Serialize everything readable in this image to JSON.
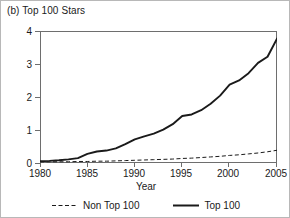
{
  "panel": {
    "title": "(b) Top 100 Stars"
  },
  "chart_data": {
    "type": "line",
    "title": "(b) Top 100 Stars",
    "xlabel": "Year",
    "ylabel": "",
    "xlim": [
      1980,
      2005
    ],
    "ylim": [
      0,
      4.35
    ],
    "xticks": [
      1980,
      1985,
      1990,
      1995,
      2000,
      2005
    ],
    "yticks": [
      0,
      1,
      2,
      3,
      4
    ],
    "grid": false,
    "legend_position": "bottom-center",
    "x": [
      1980,
      1981,
      1982,
      1983,
      1984,
      1985,
      1986,
      1987,
      1988,
      1989,
      1990,
      1991,
      1992,
      1993,
      1994,
      1995,
      1996,
      1997,
      1998,
      1999,
      2000,
      2001,
      2002,
      2003,
      2004,
      2005
    ],
    "series": [
      {
        "name": "Non Top 100",
        "style": "dashed",
        "color": "#1a1a1a",
        "values": [
          0.04,
          0.04,
          0.04,
          0.04,
          0.05,
          0.05,
          0.06,
          0.06,
          0.07,
          0.08,
          0.09,
          0.1,
          0.11,
          0.12,
          0.13,
          0.15,
          0.16,
          0.18,
          0.2,
          0.22,
          0.25,
          0.27,
          0.3,
          0.33,
          0.37,
          0.42
        ]
      },
      {
        "name": "Top 100",
        "style": "solid",
        "color": "#1a1a1a",
        "values": [
          0.06,
          0.07,
          0.09,
          0.12,
          0.16,
          0.3,
          0.38,
          0.41,
          0.48,
          0.62,
          0.78,
          0.88,
          0.97,
          1.1,
          1.28,
          1.55,
          1.6,
          1.74,
          1.95,
          2.22,
          2.58,
          2.72,
          2.96,
          3.3,
          3.5,
          4.1
        ]
      }
    ]
  },
  "axes": {
    "ytick_labels": [
      "0",
      "1",
      "2",
      "3",
      "4"
    ],
    "xtick_labels": [
      "1980",
      "1985",
      "1990",
      "1995",
      "2000",
      "2005"
    ],
    "xaxis_title": "Year"
  },
  "legend": {
    "entries": [
      {
        "label": "Non Top 100",
        "style": "dashed"
      },
      {
        "label": "Top 100",
        "style": "solid"
      }
    ]
  }
}
